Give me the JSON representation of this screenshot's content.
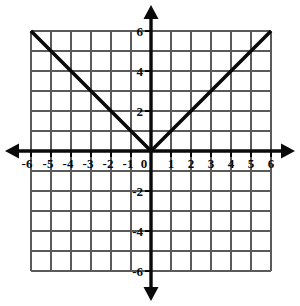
{
  "figure": {
    "background_color": "#ffffff",
    "width": 300,
    "height": 306
  },
  "chart_data": {
    "type": "line",
    "title": "",
    "subtitle": "",
    "xlabel": "",
    "ylabel": "",
    "xlim": [
      -6,
      6
    ],
    "ylim": [
      -6,
      6
    ],
    "grid": true,
    "grid_step": 1,
    "legend": "none",
    "annotations": [],
    "axis_style": {
      "x_axis_position": 0,
      "y_axis_position": 0,
      "arrows": "both-ends-both-axes",
      "axis_color": "#0a0a0a",
      "grid_color": "#5a5a5a"
    },
    "x_tick_labels": [
      "-6",
      "-5",
      "-4",
      "-3",
      "-2",
      "-1",
      "0",
      "1",
      "2",
      "3",
      "4",
      "5",
      "6"
    ],
    "x_tick_values": [
      -6,
      -5,
      -4,
      -3,
      -2,
      -1,
      0,
      1,
      2,
      3,
      4,
      5,
      6
    ],
    "y_tick_labels": [
      "6",
      "4",
      "2",
      "-2",
      "-4",
      "-6"
    ],
    "y_tick_values": [
      6,
      4,
      2,
      -2,
      -4,
      -6
    ],
    "series": [
      {
        "name": "y = |x|",
        "color": "#0a0a0a",
        "x": [
          -6,
          0,
          6
        ],
        "values": [
          6,
          0,
          6
        ]
      }
    ]
  }
}
